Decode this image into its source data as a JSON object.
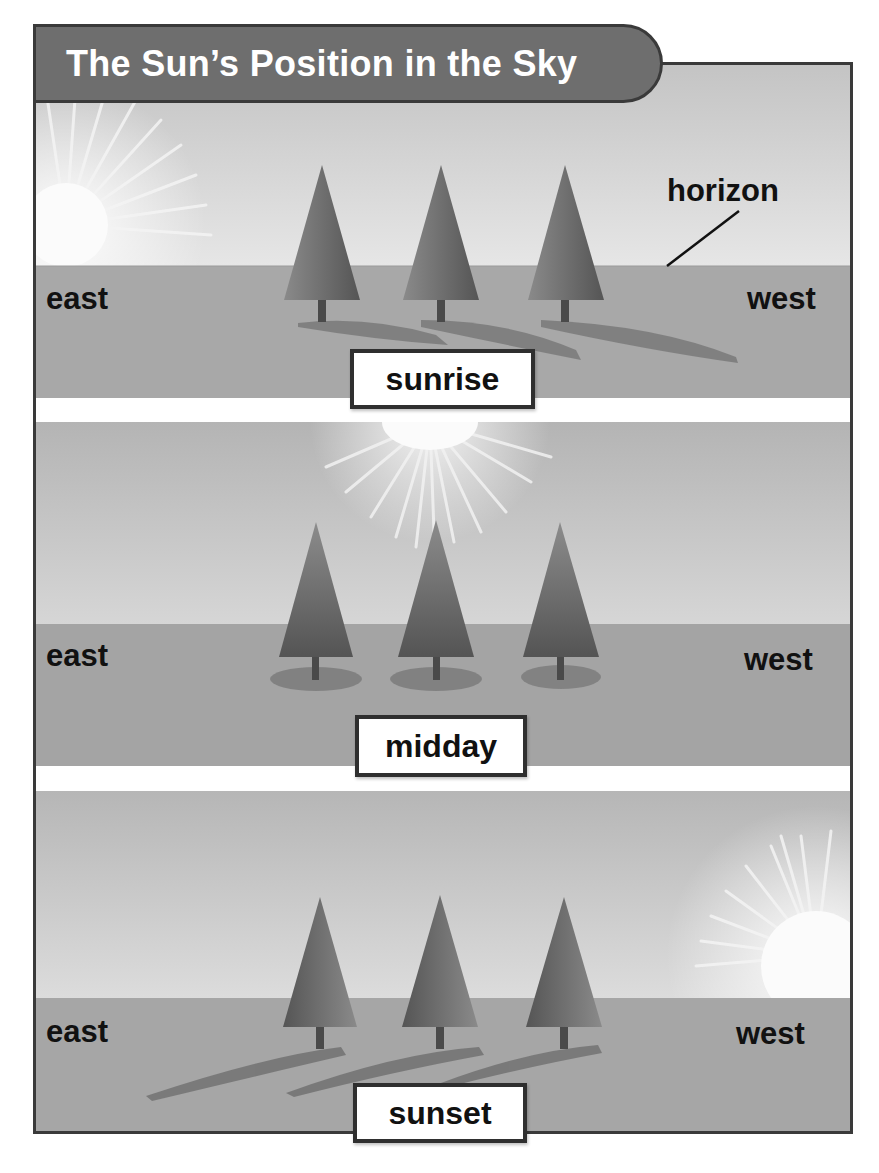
{
  "title": "The Sun’s Position in the Sky",
  "colors": {
    "title_bg": "#6e6e6e",
    "frame_border": "#3a3a3a",
    "sky_light": "#e4e4e4",
    "sky_dark": "#b8b8b8",
    "ground": "#a4a4a4",
    "tree": "#6a6a6a",
    "shadow": "#7a7a7a",
    "sun": "#fafafa"
  },
  "panels": [
    {
      "name": "sunrise",
      "label": "sunrise",
      "east_label": "east",
      "west_label": "west",
      "annotation": "horizon",
      "sun_position": "east, on horizon",
      "shadow_direction": "west"
    },
    {
      "name": "midday",
      "label": "midday",
      "east_label": "east",
      "west_label": "west",
      "sun_position": "overhead",
      "shadow_direction": "below trees"
    },
    {
      "name": "sunset",
      "label": "sunset",
      "east_label": "east",
      "west_label": "west",
      "sun_position": "west, on horizon",
      "shadow_direction": "east"
    }
  ]
}
